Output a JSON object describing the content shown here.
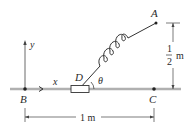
{
  "diagram": {
    "points": {
      "A": {
        "label": "A",
        "x": 156,
        "y": 23
      },
      "B": {
        "label": "B",
        "x": 25,
        "y": 89
      },
      "C": {
        "label": "C",
        "x": 154,
        "y": 89
      },
      "D": {
        "label": "D"
      }
    },
    "axes": {
      "x_label": "x",
      "y_label": "y"
    },
    "angle_label": "θ",
    "dimensions": {
      "horizontal": "1 m",
      "vertical_num": "1",
      "vertical_den": "2",
      "vertical_unit": "m"
    },
    "colors": {
      "rod": "#b8b8b8",
      "line": "#333333",
      "collar_fill": "#ffffff"
    }
  }
}
